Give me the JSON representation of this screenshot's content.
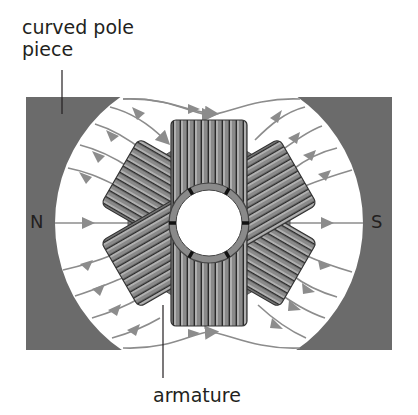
{
  "diagram": {
    "type": "dc-motor-armature-field",
    "labels": {
      "pole_piece": [
        "curved pole",
        "piece"
      ],
      "armature": "armature",
      "north": "N",
      "south": "S"
    },
    "colors": {
      "pole": "#6b6b6b",
      "coil": "#7d7d7d",
      "coil_line": "#2a2a2a",
      "armature_core": "#8a8a8a",
      "field_line": "#8c8c8c",
      "text": "#231f20"
    },
    "field_lines": {
      "direction": "N to S",
      "count_per_side": 7
    },
    "armature": {
      "coils": 3,
      "commutator_segments": 6
    }
  }
}
